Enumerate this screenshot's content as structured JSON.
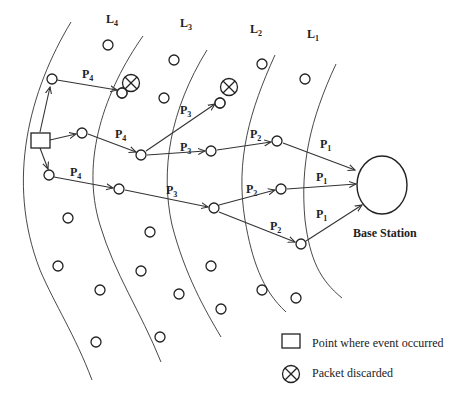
{
  "levels": [
    {
      "id": "L4",
      "label": "L",
      "sub": "4",
      "x": 106,
      "y": 23
    },
    {
      "id": "L3",
      "label": "L",
      "sub": "3",
      "x": 180,
      "y": 27
    },
    {
      "id": "L2",
      "label": "L",
      "sub": "2",
      "x": 250,
      "y": 33
    },
    {
      "id": "L1",
      "label": "L",
      "sub": "1",
      "x": 307,
      "y": 38
    }
  ],
  "path_labels": [
    {
      "text": "P",
      "sub": "4",
      "x": 82,
      "y": 78
    },
    {
      "text": "P",
      "sub": "4",
      "x": 115,
      "y": 138
    },
    {
      "text": "P",
      "sub": "4",
      "x": 70,
      "y": 176
    },
    {
      "text": "P",
      "sub": "3",
      "x": 180,
      "y": 114
    },
    {
      "text": "P",
      "sub": "3",
      "x": 180,
      "y": 151
    },
    {
      "text": "P",
      "sub": "3",
      "x": 166,
      "y": 194
    },
    {
      "text": "P",
      "sub": "2",
      "x": 250,
      "y": 138
    },
    {
      "text": "P",
      "sub": "2",
      "x": 246,
      "y": 193
    },
    {
      "text": "P",
      "sub": "2",
      "x": 270,
      "y": 230
    },
    {
      "text": "P",
      "sub": "1",
      "x": 320,
      "y": 148
    },
    {
      "text": "P",
      "sub": "1",
      "x": 316,
      "y": 181
    },
    {
      "text": "P",
      "sub": "1",
      "x": 316,
      "y": 218
    }
  ],
  "base_station": {
    "label": "Base Station",
    "cx": 382,
    "cy": 185,
    "rx": 25,
    "ry": 29
  },
  "legend": {
    "event_label": "Point where event occurred",
    "discard_label": "Packet discarded"
  },
  "colors": {
    "stroke": "#222222",
    "background": "#ffffff"
  }
}
